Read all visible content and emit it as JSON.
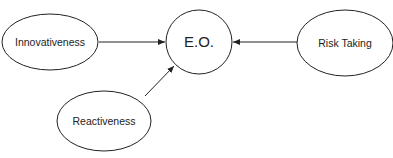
{
  "diagram": {
    "title": "",
    "center": {
      "label": "E.O."
    },
    "nodes": [
      {
        "id": "innovativeness",
        "label": "Innovativeness"
      },
      {
        "id": "reactiveness",
        "label": "Reactiveness"
      },
      {
        "id": "risk_taking",
        "label": "Risk Taking"
      }
    ],
    "edges": [
      {
        "from": "Innovativeness",
        "to": "E.O."
      },
      {
        "from": "Reactiveness",
        "to": "E.O."
      },
      {
        "from": "Risk Taking",
        "to": "E.O."
      }
    ],
    "colors": {
      "stroke": "#222222",
      "background": "#ffffff"
    }
  }
}
